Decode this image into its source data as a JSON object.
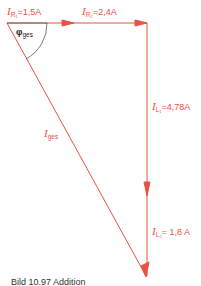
{
  "diagram": {
    "type": "phasor-diagram",
    "color": "#e8523f",
    "vectors": [
      {
        "id": "IR1",
        "symbol": "I",
        "sub": "R₁",
        "value": "=1,5A"
      },
      {
        "id": "IR2",
        "symbol": "I",
        "sub": "R₂",
        "value": "=2,4A"
      },
      {
        "id": "IL1",
        "symbol": "I",
        "sub": "L₁",
        "value": "=4,78A"
      },
      {
        "id": "IL2",
        "symbol": "I",
        "sub": "L₂",
        "value": "= 1,8 A"
      },
      {
        "id": "Iges",
        "symbol": "I",
        "sub": "ges",
        "value": ""
      }
    ],
    "angle": {
      "symbol": "φ",
      "sub": "ges"
    }
  },
  "caption": "Bild 10.97   Addition"
}
